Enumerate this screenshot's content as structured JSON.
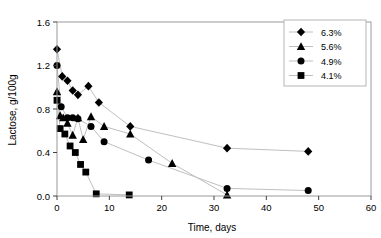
{
  "chart_data": {
    "type": "scatter",
    "title": "",
    "xlabel": "Time, days",
    "ylabel": "Lactose, g/100g",
    "xlim": [
      0,
      60
    ],
    "ylim": [
      0,
      1.6
    ],
    "xticks": [
      0,
      10,
      20,
      30,
      40,
      50,
      60
    ],
    "yticks": [
      "0.0",
      "0.4",
      "0.8",
      "1.2",
      "1.6"
    ],
    "ytick_values": [
      0.0,
      0.4,
      0.8,
      1.2,
      1.6
    ],
    "grid": false,
    "legend_position": "top-right",
    "connected": true,
    "marker_color": "#000000",
    "line_color": "#bfbfbf",
    "axis_color": "#404040",
    "series": [
      {
        "name": "6.3%",
        "marker": "diamond",
        "points": [
          {
            "x": 0.0,
            "y": 1.35
          },
          {
            "x": 1.0,
            "y": 1.1
          },
          {
            "x": 2.0,
            "y": 1.06
          },
          {
            "x": 3.0,
            "y": 0.97
          },
          {
            "x": 4.0,
            "y": 0.93
          },
          {
            "x": 6.0,
            "y": 1.01
          },
          {
            "x": 8.0,
            "y": 0.86
          },
          {
            "x": 14.0,
            "y": 0.64
          },
          {
            "x": 32.5,
            "y": 0.44
          },
          {
            "x": 48.0,
            "y": 0.41
          }
        ]
      },
      {
        "name": "5.6%",
        "marker": "triangle",
        "points": [
          {
            "x": 0.0,
            "y": 0.96
          },
          {
            "x": 0.6,
            "y": 0.74
          },
          {
            "x": 1.2,
            "y": 0.72
          },
          {
            "x": 2.0,
            "y": 0.67
          },
          {
            "x": 3.0,
            "y": 0.56
          },
          {
            "x": 4.0,
            "y": 0.72
          },
          {
            "x": 5.0,
            "y": 0.52
          },
          {
            "x": 6.5,
            "y": 0.73
          },
          {
            "x": 9.0,
            "y": 0.64
          },
          {
            "x": 14.0,
            "y": 0.57
          },
          {
            "x": 22.0,
            "y": 0.3
          },
          {
            "x": 32.5,
            "y": 0.01
          }
        ]
      },
      {
        "name": "4.9%",
        "marker": "circle",
        "points": [
          {
            "x": 0.0,
            "y": 1.2
          },
          {
            "x": 0.8,
            "y": 0.82
          },
          {
            "x": 2.0,
            "y": 0.72
          },
          {
            "x": 3.0,
            "y": 0.72
          },
          {
            "x": 4.0,
            "y": 0.71
          },
          {
            "x": 6.5,
            "y": 0.64
          },
          {
            "x": 9.0,
            "y": 0.5
          },
          {
            "x": 17.5,
            "y": 0.33
          },
          {
            "x": 32.5,
            "y": 0.07
          },
          {
            "x": 48.0,
            "y": 0.05
          }
        ]
      },
      {
        "name": "4.1%",
        "marker": "square",
        "points": [
          {
            "x": 0.0,
            "y": 0.88
          },
          {
            "x": 0.6,
            "y": 0.62
          },
          {
            "x": 1.5,
            "y": 0.57
          },
          {
            "x": 2.5,
            "y": 0.46
          },
          {
            "x": 3.5,
            "y": 0.4
          },
          {
            "x": 4.5,
            "y": 0.29
          },
          {
            "x": 5.5,
            "y": 0.22
          },
          {
            "x": 7.5,
            "y": 0.02
          },
          {
            "x": 13.8,
            "y": 0.01
          }
        ]
      }
    ]
  },
  "legend": {
    "items": [
      {
        "label": "6.3%",
        "marker": "diamond"
      },
      {
        "label": "5.6%",
        "marker": "triangle"
      },
      {
        "label": "4.9%",
        "marker": "circle"
      },
      {
        "label": "4.1%",
        "marker": "square"
      }
    ]
  }
}
